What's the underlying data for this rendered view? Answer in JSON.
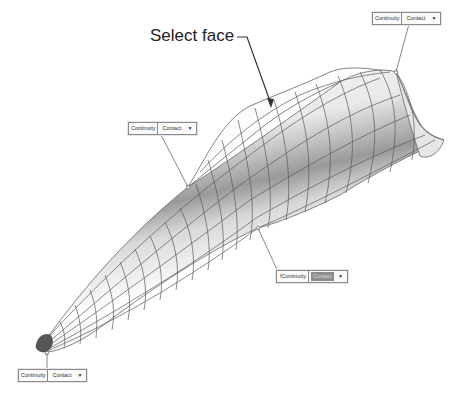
{
  "annotation": {
    "label": "Select face"
  },
  "callouts": [
    {
      "id": "top-right",
      "label": "Continuity",
      "value": "Contact",
      "highlighted": false,
      "icon": "chevron-down-icon"
    },
    {
      "id": "middle-left",
      "label": "Continuity",
      "value": "Contact",
      "highlighted": false,
      "icon": "chevron-down-icon"
    },
    {
      "id": "middle-right",
      "prefix": "f",
      "label": "Continuity",
      "value": "Contact",
      "highlighted": true,
      "icon": "chevron-down-icon"
    },
    {
      "id": "bottom-left",
      "label": "Continuity",
      "value": "Contact",
      "highlighted": false,
      "icon": "chevron-down-icon"
    }
  ],
  "colors": {
    "edge": "#555555",
    "surface_light": "#ffffff",
    "surface_shade": "#8e8e8e",
    "highlight": "#8c8c8c"
  }
}
